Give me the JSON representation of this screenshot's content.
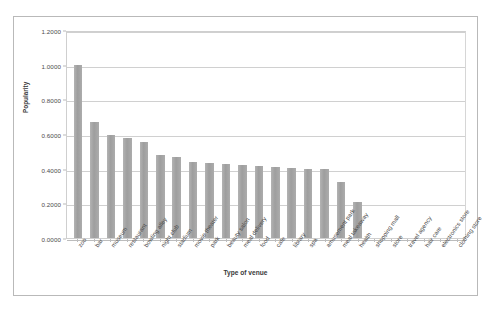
{
  "chart_data": {
    "type": "bar",
    "title": "",
    "xlabel": "Type of venue",
    "ylabel": "Popularity",
    "ylim": [
      0,
      1.2
    ],
    "yticks": [
      "0.0000",
      "0.2000",
      "0.4000",
      "0.6000",
      "0.8000",
      "1.0000",
      "1.2000"
    ],
    "ytick_values": [
      0,
      0.2,
      0.4,
      0.6,
      0.8,
      1.0,
      1.2
    ],
    "grid": true,
    "legend": "none",
    "bar_color": "#a6a6a6",
    "categories": [
      "zoo",
      "bar",
      "museum",
      "restaurant",
      "bowling alley",
      "night club",
      "stadium",
      "movie theater",
      "park",
      "beauty salon",
      "meal delivery",
      "food",
      "cafe",
      "library",
      "spa",
      "amusement park",
      "meal takeaway",
      "health",
      "shopping mall",
      "store",
      "travel agency",
      "hair care",
      "electronics store",
      "clothing store"
    ],
    "values": [
      1.0,
      0.67,
      0.595,
      0.575,
      0.555,
      0.48,
      0.465,
      0.44,
      0.43,
      0.425,
      0.42,
      0.415,
      0.41,
      0.405,
      0.4,
      0.4,
      0.325,
      0.21,
      0,
      0,
      0,
      0,
      0,
      0
    ]
  }
}
